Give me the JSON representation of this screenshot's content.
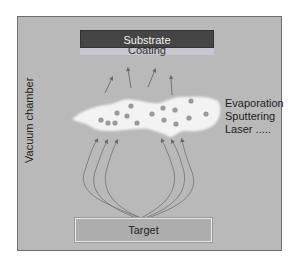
{
  "diagram": {
    "chamber_label": "Vacuum chamber",
    "substrate_label": "Substrate",
    "coating_label": "Coating",
    "methods": [
      "Evaporation",
      "Sputtering",
      "Laser ....."
    ],
    "target_label": "Target",
    "colors": {
      "chamber": "#b9b9b9",
      "substrate": "#454545",
      "coating": "#c7c7cf",
      "vapor_cloud": "#f3f3f3",
      "particles": "#9a9a9a",
      "target": "#adadad",
      "arrows": "#6a6a6a"
    }
  }
}
